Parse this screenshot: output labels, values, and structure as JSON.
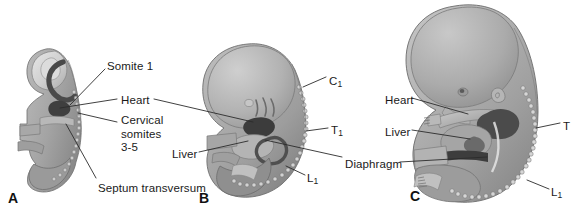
{
  "figure": {
    "background_color": "#ffffff",
    "ink_color": "#1a1a1a",
    "leader_line_color": "#2b2b2b",
    "width": 581,
    "height": 214
  },
  "panels": [
    {
      "id": "A",
      "letter": "A",
      "x": 8,
      "y": 190,
      "caption": "Embryo at approximately 4 weeks, sagittal section"
    },
    {
      "id": "B",
      "letter": "B",
      "x": 199,
      "y": 190,
      "caption": "Embryo at approximately 5 weeks, lateral view"
    },
    {
      "id": "C",
      "letter": "C",
      "x": 410,
      "y": 188,
      "caption": "Fetus at approximately 8 weeks, lateral view"
    }
  ],
  "labels": [
    {
      "id": "somite-1",
      "text": "Somite 1",
      "x": 107,
      "y": 60,
      "panel": "A",
      "align": "left"
    },
    {
      "id": "heart-a",
      "text": "Heart",
      "x": 121,
      "y": 94,
      "panel": "A",
      "align": "left"
    },
    {
      "id": "cervical-somites",
      "text": "Cervical\nsomites\n3-5",
      "x": 121,
      "y": 114,
      "panel": "A",
      "align": "left"
    },
    {
      "id": "septum-transversum",
      "text": "Septum transversum",
      "x": 98,
      "y": 182,
      "panel": "A",
      "align": "left"
    },
    {
      "id": "liver-b",
      "text": "Liver",
      "x": 172,
      "y": 148,
      "panel": "B",
      "align": "left"
    },
    {
      "id": "c1-b",
      "text": "C",
      "sub": "1",
      "x": 329,
      "y": 75,
      "panel": "B",
      "align": "left"
    },
    {
      "id": "t1-b",
      "text": "T",
      "sub": "1",
      "x": 331,
      "y": 124,
      "panel": "B",
      "align": "left"
    },
    {
      "id": "l1-b",
      "text": "L",
      "sub": "1",
      "x": 307,
      "y": 172,
      "panel": "B",
      "align": "left"
    },
    {
      "id": "heart-c",
      "text": "Heart",
      "x": 385,
      "y": 94,
      "panel": "C",
      "align": "left"
    },
    {
      "id": "liver-c",
      "text": "Liver",
      "x": 385,
      "y": 126,
      "panel": "C",
      "align": "left"
    },
    {
      "id": "diaphragm-c",
      "text": "Diaphragm",
      "x": 345,
      "y": 158,
      "panel": "C",
      "align": "left"
    },
    {
      "id": "t-c",
      "text": "T",
      "x": 563,
      "y": 120,
      "panel": "C",
      "align": "left"
    },
    {
      "id": "l1-c",
      "text": "L",
      "sub": "1",
      "x": 551,
      "y": 186,
      "panel": "C",
      "align": "left"
    }
  ],
  "leader_lines": [
    {
      "id": "leader-somite-1",
      "from": [
        105,
        69
      ],
      "to": [
        70,
        105
      ]
    },
    {
      "id": "leader-heart-a-left",
      "from": [
        117,
        99
      ],
      "to": [
        60,
        108
      ]
    },
    {
      "id": "leader-heart-a-to-b",
      "from": [
        154,
        99
      ],
      "to": [
        253,
        122
      ]
    },
    {
      "id": "leader-cervical-somites",
      "from": [
        117,
        122
      ],
      "to": [
        78,
        113
      ]
    },
    {
      "id": "leader-septum-transversum",
      "from": [
        96,
        178
      ],
      "to": [
        66,
        124
      ]
    },
    {
      "id": "leader-liver-b",
      "from": [
        199,
        152
      ],
      "to": [
        248,
        141
      ]
    },
    {
      "id": "leader-c1-b",
      "from": [
        326,
        77
      ],
      "to": [
        303,
        87
      ]
    },
    {
      "id": "leader-t1-b",
      "from": [
        328,
        128
      ],
      "to": [
        306,
        131
      ]
    },
    {
      "id": "leader-l1-b",
      "from": [
        305,
        175
      ],
      "to": [
        286,
        166
      ]
    },
    {
      "id": "leader-diaphragm-b",
      "from": [
        342,
        157
      ],
      "to": [
        265,
        140
      ]
    },
    {
      "id": "leader-heart-c",
      "from": [
        412,
        98
      ],
      "to": [
        468,
        114
      ]
    },
    {
      "id": "leader-liver-c",
      "from": [
        412,
        130
      ],
      "to": [
        470,
        139
      ]
    },
    {
      "id": "leader-diaphragm-c",
      "from": [
        400,
        162
      ],
      "to": [
        487,
        157
      ]
    },
    {
      "id": "leader-t-c",
      "from": [
        560,
        123
      ],
      "to": [
        536,
        128
      ]
    },
    {
      "id": "leader-l1-c",
      "from": [
        549,
        189
      ],
      "to": [
        527,
        180
      ]
    }
  ],
  "artwork": {
    "style": "grayscale halftone anatomical illustration",
    "palette": {
      "body_light": "#c9c9c9",
      "body_mid": "#ababab",
      "body_dark": "#8d8d8d",
      "body_darker": "#6f6f6f",
      "organ_dark": "#555555",
      "organ_darkest": "#3a3a3a",
      "highlight": "#e2e2e2",
      "outline": "#6a6a6a",
      "somite_bead": "#cfcfcf",
      "somite_bead_edge": "#7a7a7a"
    },
    "panel_a": {
      "description": "Early embryo sagittal section, C-shaped, pale head fold with dark pericardial cavity, yolk stalk / allantois below",
      "somite_count": 16
    },
    "panel_b": {
      "description": "Embryo lateral view with large head, somite column along dorsal surface, heart and liver visible through body wall",
      "somite_count": 26
    },
    "panel_c": {
      "description": "Fetus lateral view with limbs, ear, eye, somite column along back, heart, liver and diaphragm shown",
      "somite_count": 30
    }
  }
}
